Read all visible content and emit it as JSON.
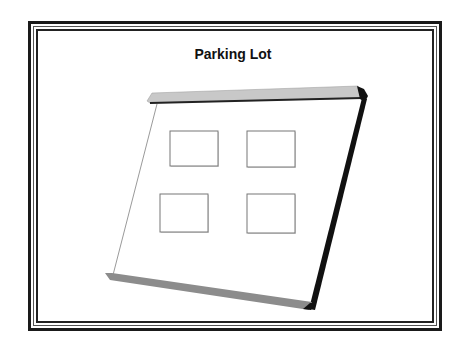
{
  "diagram": {
    "title": "Parking Lot",
    "colors": {
      "frame": "#1a1a1a",
      "slab_top": "#c8c8c8",
      "slab_bottom": "#8c8c8c",
      "edge_dark": "#111111",
      "thin_line": "#9a9a9a",
      "space_border": "#777777"
    },
    "parking_spaces": [
      {
        "id": "space-1",
        "x": 170,
        "y": 131,
        "w": 48,
        "h": 35
      },
      {
        "id": "space-2",
        "x": 247,
        "y": 131,
        "w": 48,
        "h": 36
      },
      {
        "id": "space-3",
        "x": 160,
        "y": 194,
        "w": 48,
        "h": 38
      },
      {
        "id": "space-4",
        "x": 247,
        "y": 194,
        "w": 48,
        "h": 39
      }
    ]
  }
}
